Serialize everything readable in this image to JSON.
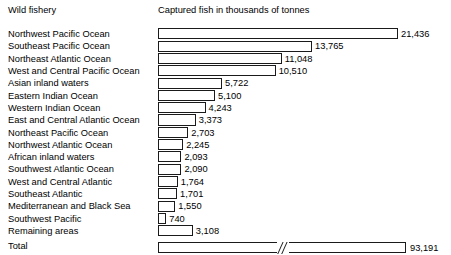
{
  "header": {
    "category_label": "Wild fishery",
    "value_label": "Captured fish in thousands of tonnes"
  },
  "chart_data": {
    "type": "bar",
    "orientation": "horizontal",
    "title": "",
    "xlabel": "Captured fish in thousands of tonnes",
    "ylabel": "Wild fishery",
    "grid": false,
    "legend": null,
    "axis_break": true,
    "axis_break_note": "Total bar drawn with a broken axis (//) so it fits the same width scale",
    "units": "thousands of tonnes",
    "xlim": [
      0,
      21436
    ],
    "categories": [
      "Northwest Pacific Ocean",
      "Southeast Pacific Ocean",
      "Northeast Atlantic Ocean",
      "West and Central Pacific Ocean",
      "Asian inland waters",
      "Eastern Indian Ocean",
      "Western Indian Ocean",
      "East and Central Atlantic Ocean",
      "Northeast Pacific Ocean",
      "Northwest Atlantic Ocean",
      "African inland waters",
      "Southwest Atlantic Ocean",
      "West and Central Atlantic",
      "Southeast Atlantic",
      "Mediterranean and Black Sea",
      "Southwest Pacific",
      "Remaining areas"
    ],
    "values": [
      21436,
      13765,
      11048,
      10510,
      5722,
      5100,
      4243,
      3373,
      2703,
      2245,
      2093,
      2090,
      1764,
      1701,
      1550,
      740,
      3108
    ],
    "value_labels": [
      "21,436",
      "13,765",
      "11,048",
      "10,510",
      "5,722",
      "5,100",
      "4,243",
      "3,373",
      "2,703",
      "2,245",
      "2,093",
      "2,090",
      "1,764",
      "1,701",
      "1,550",
      "740",
      "3,108"
    ],
    "total": {
      "label": "Total",
      "value": 93191,
      "value_label": "93,191"
    }
  },
  "style": {
    "bar_fill": "#ffffff",
    "bar_stroke": "#1a1a1a",
    "background": "#ffffff",
    "text_color": "#000000"
  }
}
